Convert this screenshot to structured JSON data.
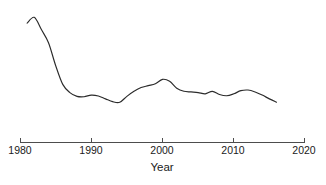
{
  "chart_data": {
    "type": "line",
    "title": "",
    "subtitle": "",
    "xlabel": "Year",
    "ylabel": "",
    "grid": false,
    "legend": null,
    "xlim": [
      1980,
      2020
    ],
    "ylim": [
      0,
      100
    ],
    "xticks": [
      1980,
      1990,
      2000,
      2010,
      2020
    ],
    "xtick_labels": [
      "1980",
      "1990",
      "2000",
      "2010",
      "2020"
    ],
    "yticks": [],
    "ytick_labels": [],
    "series": [
      {
        "name": "value",
        "x": [
          1981,
          1982,
          1983,
          1984,
          1985,
          1986,
          1987,
          1988,
          1989,
          1990,
          1991,
          1992,
          1993,
          1994,
          1995,
          1996,
          1997,
          1998,
          1999,
          2000,
          2001,
          2002,
          2003,
          2004,
          2005,
          2006,
          2007,
          2008,
          2009,
          2010,
          2011,
          2012,
          2013,
          2014,
          2015,
          2016
        ],
        "y": [
          85.6,
          90.2,
          80.5,
          70.0,
          52.0,
          37.0,
          30.5,
          27.5,
          27.2,
          28.5,
          27.8,
          25.5,
          23.3,
          22.8,
          27.5,
          31.5,
          34.5,
          36.0,
          37.5,
          41.0,
          39.5,
          34.0,
          31.5,
          31.0,
          30.5,
          29.5,
          31.5,
          29.0,
          28.0,
          29.5,
          32.0,
          32.5,
          31.0,
          28.5,
          25.5,
          22.8
        ]
      }
    ]
  },
  "axis": {
    "x_title": "Year",
    "tick_1980": "1980",
    "tick_1990": "1990",
    "tick_2000": "2000",
    "tick_2010": "2010",
    "tick_2020": "2020"
  },
  "colors": {
    "line": "#2b2b2b",
    "axis": "#4d4d4d",
    "background": "#ffffff",
    "text": "#1a1a1a"
  }
}
